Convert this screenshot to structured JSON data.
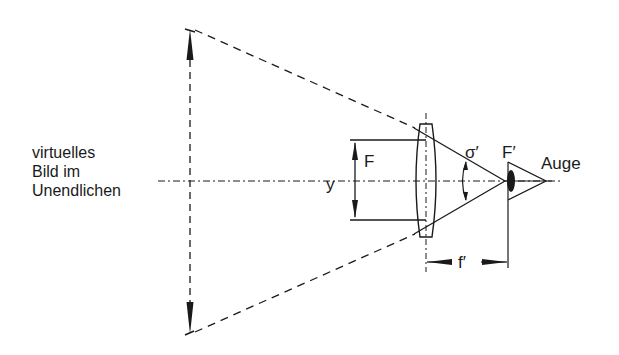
{
  "diagram": {
    "type": "optics-magnifier",
    "colors": {
      "ink": "#1a1a1a",
      "background": "#ffffff"
    },
    "labels": {
      "virtual_image_line1": "virtuelles",
      "virtual_image_line2": "Bild im",
      "virtual_image_line3": "Unendlichen",
      "object": "F",
      "object_height": "y",
      "angle": "σ′",
      "focal_point": "F′",
      "eye": "Auge",
      "focal_length": "f′"
    },
    "elements": [
      "virtual-image-arrow",
      "optical-axis",
      "converging-lens",
      "object-arrow",
      "rays",
      "angle-arc",
      "eye",
      "focal-length-dimension"
    ]
  }
}
